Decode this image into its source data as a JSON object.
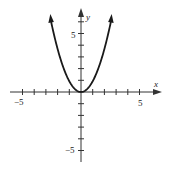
{
  "chart_data": {
    "type": "line",
    "title": "",
    "function": "y = x^2",
    "xlabel": "x",
    "ylabel": "y",
    "xlim": [
      -6,
      6
    ],
    "ylim": [
      -6,
      7
    ],
    "grid": false,
    "legend": null,
    "x_tick_labels": [
      "-5",
      "5"
    ],
    "y_tick_labels": [
      "5",
      "-5"
    ],
    "x": [
      -2.6,
      -2,
      -1.5,
      -1,
      -0.5,
      0,
      0.5,
      1,
      1.5,
      2,
      2.6
    ],
    "series": [
      {
        "name": "y = x^2",
        "values": [
          6.76,
          4,
          2.25,
          1,
          0.25,
          0,
          0.25,
          1,
          2.25,
          4,
          6.76
        ]
      }
    ],
    "annotations": [
      "arrowheads on both ends of the curve",
      "arrowheads on positive x and y axes"
    ]
  },
  "labels": {
    "x_axis": "x",
    "y_axis": "y",
    "x_neg": "−5",
    "x_pos": "5",
    "y_pos": "5",
    "y_neg": "−5"
  },
  "colors": {
    "curve": "#1a1a1a",
    "axis": "#333333"
  }
}
